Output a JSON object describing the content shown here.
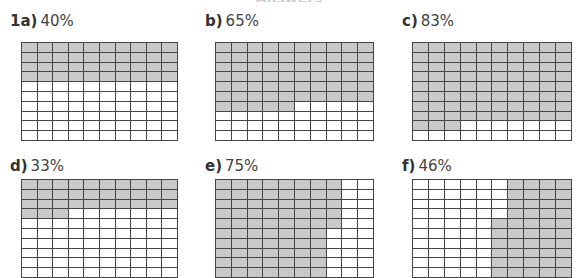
{
  "header": {
    "title_fragment": "Answers"
  },
  "style": {
    "shaded_color": "#c9c9c9",
    "line_color": "#444444"
  },
  "grid": {
    "rows": 10,
    "cols": 10
  },
  "problems": [
    {
      "key": "1a)",
      "percent": "40%",
      "value": 40,
      "shaded": {
        "full_rows_top": 4,
        "partial_row_cells": 0
      },
      "pos": {
        "label_x": 10,
        "label_y": 12,
        "grid_x": 21,
        "grid_y": 42,
        "grid_w": 157,
        "grid_h": 99
      },
      "fill": "rows"
    },
    {
      "key": "b)",
      "percent": "65%",
      "value": 65,
      "pos": {
        "label_x": 205,
        "label_y": 12,
        "grid_x": 215,
        "grid_y": 42,
        "grid_w": 159,
        "grid_h": 99
      },
      "fill": "rows"
    },
    {
      "key": "c)",
      "percent": "83%",
      "value": 83,
      "pos": {
        "label_x": 402,
        "label_y": 12,
        "grid_x": 412,
        "grid_y": 42,
        "grid_w": 160,
        "grid_h": 99
      },
      "fill": "rows"
    },
    {
      "key": "d)",
      "percent": "33%",
      "value": 33,
      "pos": {
        "label_x": 10,
        "label_y": 157,
        "grid_x": 21,
        "grid_y": 179,
        "grid_w": 157,
        "grid_h": 99
      },
      "fill": "rows"
    },
    {
      "key": "e)",
      "percent": "75%",
      "value": 75,
      "pos": {
        "label_x": 205,
        "label_y": 157,
        "grid_x": 215,
        "grid_y": 179,
        "grid_w": 159,
        "grid_h": 99
      },
      "fill": "cols-left"
    },
    {
      "key": "f)",
      "percent": "46%",
      "value": 46,
      "pos": {
        "label_x": 402,
        "label_y": 157,
        "grid_x": 412,
        "grid_y": 179,
        "grid_w": 160,
        "grid_h": 99
      },
      "fill": "cols-right-bottom"
    }
  ]
}
